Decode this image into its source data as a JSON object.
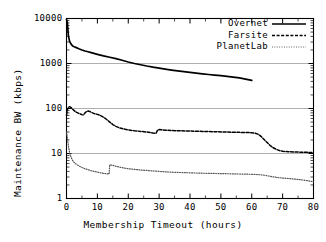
{
  "chart_data": {
    "type": "line",
    "title": "",
    "xlabel": "Membership Timeout (hours)",
    "ylabel": "Maintenance BW (kbps)",
    "xlim": [
      0,
      80
    ],
    "ylim": [
      1,
      10000
    ],
    "yscale": "log",
    "xscale": "linear",
    "grid": "horizontal-major",
    "legend_position": "top-right-inside",
    "xticks": [
      0,
      10,
      20,
      30,
      40,
      50,
      60,
      70,
      80
    ],
    "xtick_labels": [
      "0",
      "10",
      "20",
      "30",
      "40",
      "50",
      "60",
      "70",
      "80"
    ],
    "yticks": [
      1,
      10,
      100,
      1000,
      10000
    ],
    "ytick_labels": [
      "1",
      "10",
      "100",
      "1000",
      "10000"
    ],
    "series": [
      {
        "name": "Overnet",
        "style": "solid",
        "color": "#000000",
        "width": 1.7,
        "x": [
          0,
          0.3,
          0.6,
          1,
          1.5,
          2,
          2.5,
          3,
          4,
          5,
          6,
          7,
          8,
          10,
          12,
          14,
          16,
          18,
          20,
          22,
          24,
          26,
          28,
          30,
          32,
          34,
          36,
          38,
          40,
          42,
          44,
          46,
          48,
          50,
          52,
          54,
          56,
          58,
          60
        ],
        "y": [
          9600,
          7800,
          4200,
          3100,
          2700,
          2450,
          2350,
          2280,
          2120,
          2000,
          1900,
          1820,
          1740,
          1600,
          1480,
          1380,
          1280,
          1180,
          1080,
          1000,
          940,
          880,
          830,
          790,
          750,
          715,
          685,
          660,
          635,
          612,
          590,
          570,
          552,
          535,
          518,
          500,
          478,
          450,
          420
        ]
      },
      {
        "name": "Farsite",
        "style": "dashed",
        "color": "#000000",
        "width": 1.5,
        "x": [
          0,
          0.3,
          0.7,
          1,
          1.5,
          2,
          3,
          4,
          5,
          5.5,
          6,
          6.5,
          7,
          7.5,
          8,
          9,
          10,
          11,
          12,
          13,
          14,
          15,
          16,
          17,
          18,
          19,
          20,
          22,
          24,
          26,
          28,
          29,
          29.5,
          30,
          32,
          34,
          36,
          40,
          44,
          48,
          52,
          56,
          60,
          61,
          62,
          63,
          64,
          65,
          66,
          67,
          68,
          69,
          70,
          72,
          74,
          76,
          78,
          80
        ],
        "y": [
          70,
          95,
          108,
          110,
          105,
          96,
          84,
          78,
          73,
          72,
          80,
          86,
          88,
          86,
          82,
          77,
          74,
          70,
          64,
          57,
          50,
          44,
          40,
          37.5,
          36,
          34.5,
          33.5,
          32,
          31,
          30,
          28.5,
          28.2,
          33,
          34,
          33,
          32.5,
          32,
          31.5,
          31,
          30.5,
          30,
          29.5,
          29,
          28.5,
          27,
          24,
          20.5,
          17.5,
          15,
          13.4,
          12.3,
          11.6,
          11.2,
          11,
          10.8,
          10.7,
          10.6,
          10.5
        ]
      },
      {
        "name": "PlanetLab",
        "style": "dotted",
        "color": "#555555",
        "width": 1.2,
        "x": [
          0,
          0.3,
          0.6,
          1,
          1.5,
          2,
          2.5,
          3,
          4,
          5,
          6,
          7,
          8,
          9,
          10,
          11,
          12,
          13,
          13.8,
          14,
          15,
          16,
          17,
          18,
          20,
          22,
          24,
          26,
          28,
          30,
          32,
          34,
          36,
          40,
          44,
          48,
          52,
          56,
          60,
          62,
          64,
          66,
          68,
          70,
          72,
          74,
          76,
          78,
          80
        ],
        "y": [
          30,
          22,
          15,
          10.5,
          8.2,
          7.0,
          6.3,
          5.9,
          5.3,
          4.9,
          4.6,
          4.35,
          4.15,
          4.0,
          3.85,
          3.72,
          3.62,
          3.55,
          3.5,
          5.6,
          5.45,
          5.2,
          5.0,
          4.85,
          4.6,
          4.45,
          4.3,
          4.2,
          4.1,
          4.0,
          3.92,
          3.85,
          3.8,
          3.72,
          3.65,
          3.6,
          3.55,
          3.5,
          3.45,
          3.4,
          3.3,
          3.1,
          2.95,
          2.85,
          2.78,
          2.7,
          2.6,
          2.5,
          2.35
        ]
      }
    ],
    "legend": [
      {
        "label": "Overnet",
        "style": "solid"
      },
      {
        "label": "Farsite",
        "style": "dashed"
      },
      {
        "label": "PlanetLab",
        "style": "dotted"
      }
    ]
  }
}
